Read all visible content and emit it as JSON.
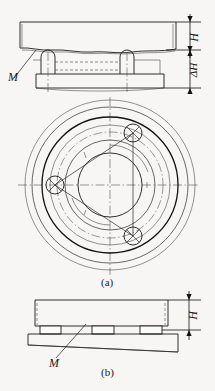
{
  "figure": {
    "type": "engineering-drawing",
    "title": "",
    "background_color": "#f7f6f4",
    "line_color": "#1a1a1a",
    "captions": {
      "a": "(a)",
      "b": "(b)"
    },
    "labels": {
      "m_top": "M",
      "m_bottom": "M",
      "height_top": "H",
      "delta_height": "ΔH",
      "height_bottom": "H"
    }
  },
  "view_a_elevation": {
    "name": "top-elevation-view",
    "description": "workpiece plate supported on two round-top posts over a base plate",
    "plate": {
      "x": 20,
      "y": 22,
      "width": 155,
      "height": 28
    },
    "posts": [
      {
        "cx": 48,
        "cy": 52,
        "width": 14,
        "height": 22
      },
      {
        "cx": 127,
        "cy": 52,
        "width": 14,
        "height": 22
      }
    ],
    "base_plate": {
      "x": 36,
      "y": 73,
      "width": 128,
      "height": 15
    },
    "wavy_interface_y": 50
  },
  "view_a_plan": {
    "name": "plan-view-circular-flange",
    "center": {
      "x": 110,
      "y": 185
    },
    "circles_radii": [
      85,
      78,
      68,
      58,
      48,
      40,
      32
    ],
    "bolt_circle_radius": 53,
    "bolt_hole_radius": 9,
    "bolt_holes": [
      {
        "label": "bolt-hole-upper-right",
        "cx": 133,
        "cy": 133,
        "angle_deg": -60
      },
      {
        "label": "bolt-hole-left",
        "cx": 55,
        "cy": 185,
        "angle_deg": 180
      },
      {
        "label": "bolt-hole-lower-right",
        "cx": 133,
        "cy": 236,
        "angle_deg": 60
      }
    ],
    "centerlines": {
      "horizontal_y": 185,
      "vertical_x": 110
    }
  },
  "view_b_elevation": {
    "name": "bottom-elevation-view",
    "description": "workpiece plate resting on three parallel blocks over a tilted base plate",
    "plate": {
      "x": 35,
      "y": 300,
      "width": 133,
      "height": 26
    },
    "blocks": [
      {
        "x": 40,
        "y": 326,
        "width": 20,
        "height": 8
      },
      {
        "x": 92,
        "y": 326,
        "width": 22,
        "height": 8
      },
      {
        "x": 140,
        "y": 326,
        "width": 22,
        "height": 8
      }
    ],
    "base_plate": {
      "x": 28,
      "y": 334,
      "width": 150,
      "height": 17,
      "tilted": true
    }
  },
  "dimensions": {
    "top_H": {
      "label": "H",
      "x_line": 188,
      "y_top": 22,
      "y_bottom": 50
    },
    "top_delta_H": {
      "label": "ΔH",
      "x_line": 188,
      "y_top": 50,
      "y_bottom": 90
    },
    "bottom_H": {
      "label": "H",
      "x_line": 188,
      "y_top": 300,
      "y_bottom": 330
    }
  }
}
